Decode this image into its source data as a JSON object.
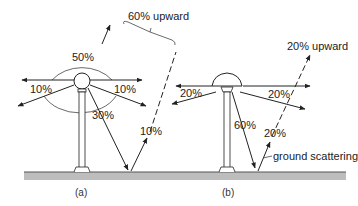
{
  "diagram": {
    "panel_a": {
      "caption": "(a)",
      "lamp_type": "globe",
      "labels": {
        "top": "50%",
        "left": "10%",
        "right": "10%",
        "down": "30%",
        "reflected": "10%",
        "upward_total": "60% upward"
      }
    },
    "panel_b": {
      "caption": "(b)",
      "lamp_type": "dome-shielded",
      "labels": {
        "left": "20%",
        "right": "20%",
        "down": "60%",
        "reflected": "20%",
        "upward_total": "20% upward",
        "ground_scattering": "ground scattering"
      }
    }
  }
}
